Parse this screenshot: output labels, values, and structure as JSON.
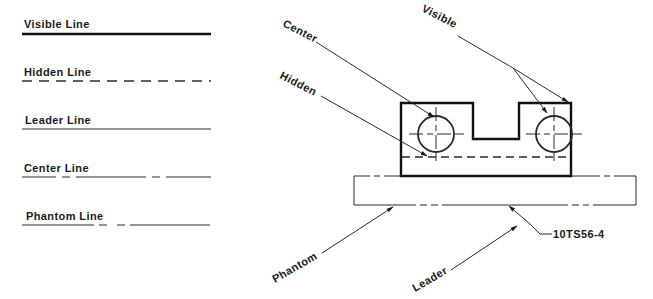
{
  "legend": {
    "items": [
      {
        "label": "Visible Line",
        "style": "visible"
      },
      {
        "label": "Hidden Line",
        "style": "hidden"
      },
      {
        "label": "Leader Line",
        "style": "leader"
      },
      {
        "label": "Center Line",
        "style": "center"
      },
      {
        "label": "Phantom Line",
        "style": "phantom"
      }
    ]
  },
  "drawing": {
    "callouts": {
      "center": "Center",
      "hidden": "Hidden",
      "visible": "Visible",
      "phantom": "Phantom",
      "leader": "Leader",
      "part_number": "10TS56-4"
    }
  },
  "colors": {
    "ink": "#1a1a1a",
    "background": "#ffffff"
  }
}
